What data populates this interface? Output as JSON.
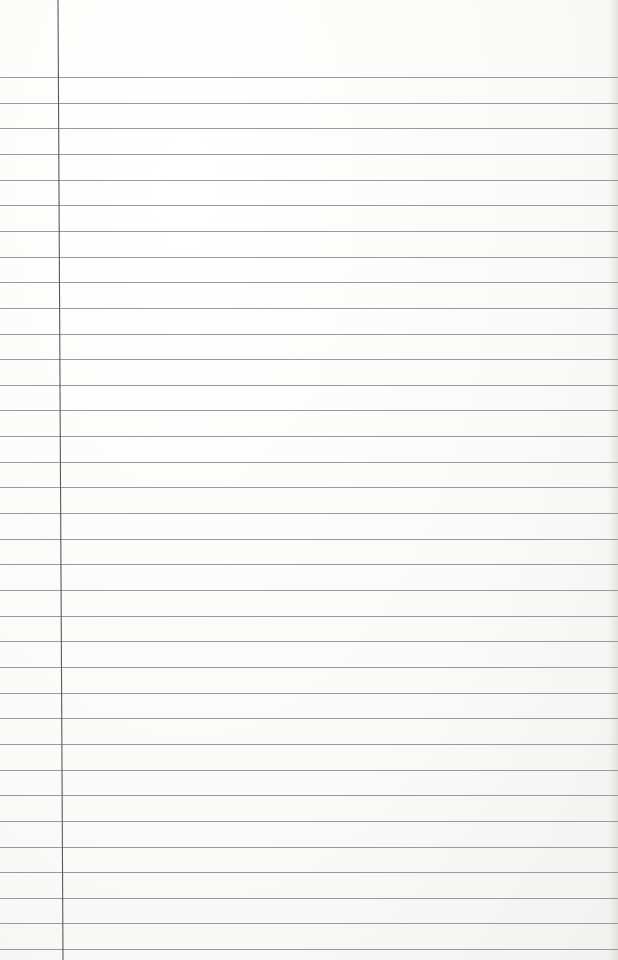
{
  "paper": {
    "background": "#fbfbfa",
    "rule_color": "#9a9a9a",
    "margin_color": "#5a5a5a",
    "first_rule_y": 77,
    "rule_spacing": 25.65,
    "rule_count": 35,
    "margin_x_top": 58,
    "margin_x_bottom": 63
  }
}
